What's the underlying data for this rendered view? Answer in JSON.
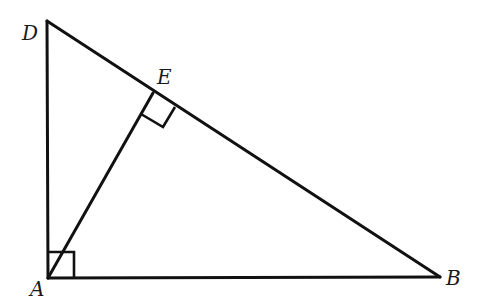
{
  "diagram": {
    "type": "geometry-right-triangle",
    "points": {
      "A": {
        "label": "A",
        "x": 48,
        "y": 278
      },
      "B": {
        "label": "B",
        "x": 440,
        "y": 277
      },
      "D": {
        "label": "D",
        "x": 47,
        "y": 21
      },
      "E": {
        "label": "E",
        "x": 153,
        "y": 93
      }
    },
    "segments": [
      "AD",
      "AB",
      "DB",
      "AE"
    ],
    "right_angles": [
      "DAB",
      "AED"
    ],
    "labels": {
      "A": "A",
      "B": "B",
      "D": "D",
      "E": "E"
    },
    "colors": {
      "stroke": "#111111",
      "background": "#ffffff"
    }
  }
}
